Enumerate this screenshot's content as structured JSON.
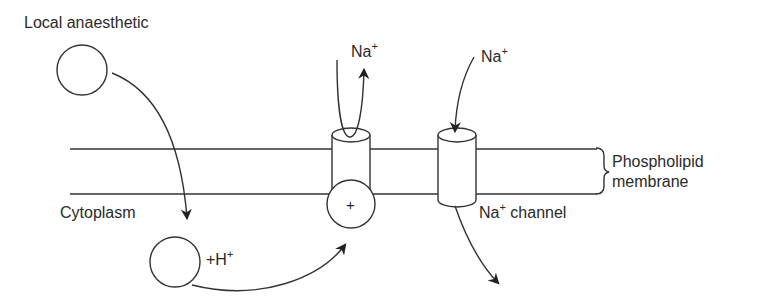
{
  "diagram": {
    "labels": {
      "local_anaesthetic": "Local anaesthetic",
      "cytoplasm": "Cytoplasm",
      "protonation": "+H",
      "protonation_sup": "+",
      "na_left": "Na",
      "na_left_sup": "+",
      "na_right": "Na",
      "na_right_sup": "+",
      "na_channel": "Na",
      "na_channel_sup": "+",
      "na_channel_suffix": " channel",
      "membrane_line1": "Phospholipid",
      "membrane_line2": "membrane",
      "charged_symbol": "+"
    },
    "colors": {
      "stroke": "#333333",
      "text": "#2a2a2a",
      "background": "#ffffff"
    }
  }
}
